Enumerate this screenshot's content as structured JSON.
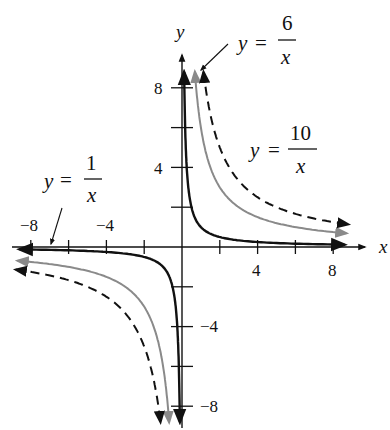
{
  "chart_data": {
    "type": "line",
    "title": "",
    "xlabel": "x",
    "ylabel": "y",
    "xlim": [
      -9,
      9
    ],
    "ylim": [
      -9,
      9
    ],
    "grid": false,
    "x_ticks": [
      -8,
      -6,
      -4,
      -2,
      2,
      4,
      6,
      8
    ],
    "x_tick_labels": [
      "-8",
      "-4",
      "4",
      "8"
    ],
    "y_ticks": [
      -8,
      -6,
      -4,
      -2,
      2,
      4,
      6,
      8
    ],
    "y_tick_labels": [
      "8",
      "4",
      "-4",
      "-8"
    ],
    "series": [
      {
        "name": "y = 1/x",
        "k": 1,
        "style": "solid",
        "color": "#111111"
      },
      {
        "name": "y = 6/x",
        "k": 6,
        "style": "solid",
        "color": "#8a8a8a"
      },
      {
        "name": "y = 10/x",
        "k": 10,
        "style": "dashed",
        "color": "#111111"
      }
    ],
    "annotations": [
      {
        "text": "y = 1/x",
        "numerator": "1",
        "position": "upper-left, arrow pointing to left branch near x-axis"
      },
      {
        "text": "y = 6/x",
        "numerator": "6",
        "position": "top, arrow pointing to top of gray branch"
      },
      {
        "text": "y = 10/x",
        "numerator": "10",
        "position": "right of dashed branch"
      }
    ]
  },
  "labels": {
    "x_axis": "x",
    "y_axis": "y",
    "tick_neg8_x": "−8",
    "tick_neg4_x": "−4",
    "tick_4_x": "4",
    "tick_8_x": "8",
    "tick_8_y": "8",
    "tick_4_y": "4",
    "tick_neg4_y": "−4",
    "tick_neg8_y": "−8",
    "eq_y": "y",
    "eq_equals": "=",
    "eq_x": "x",
    "eq1_num": "1",
    "eq6_num": "6",
    "eq10_num": "10"
  },
  "colors": {
    "ink": "#111111",
    "gray_curve": "#8a8a8a",
    "background": "#ffffff"
  }
}
